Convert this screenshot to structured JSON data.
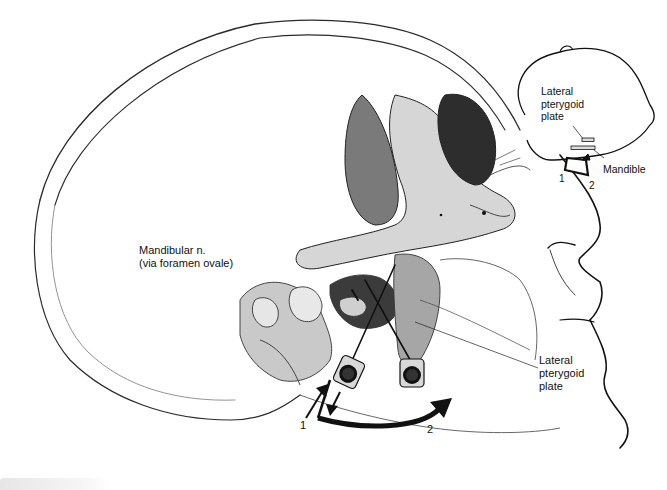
{
  "figure": {
    "labels": {
      "mandibular_nerve_line1": "Mandibular n.",
      "mandibular_nerve_line2": "(via foramen ovale)",
      "lateral_pterygoid_main_line1": "Lateral",
      "lateral_pterygoid_main_line2": "pterygoid",
      "lateral_pterygoid_main_line3": "plate",
      "needle_position_1": "1",
      "needle_position_2": "2"
    },
    "inset": {
      "lateral_pterygoid_line1": "Lateral",
      "lateral_pterygoid_line2": "pterygoid",
      "lateral_pterygoid_line3": "plate",
      "mandible": "Mandible",
      "position_1": "1",
      "position_2": "2"
    },
    "colors": {
      "line": "#1a1a1a",
      "bone_shade": "#8a8a8a",
      "dark_shade": "#3a3a3a",
      "background": "#ffffff"
    }
  }
}
